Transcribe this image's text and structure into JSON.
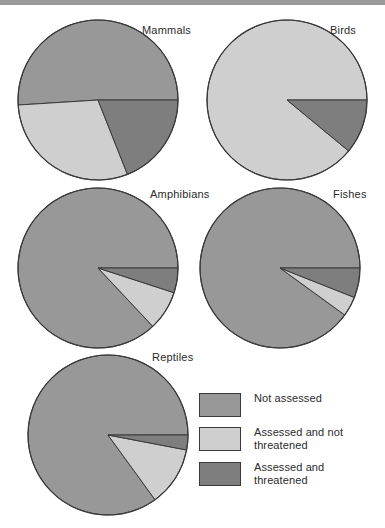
{
  "page": {
    "background": "#ffffff",
    "top_band_color": "#9a9a9a"
  },
  "legend": {
    "items": [
      {
        "label": "Not assessed",
        "color": "#989898",
        "key": "not_assessed"
      },
      {
        "label": "Assessed and not threatened",
        "color": "#cfcfcf",
        "key": "assessed_not_threatened"
      },
      {
        "label": "Assessed and threatened",
        "color": "#7e7e7e",
        "key": "assessed_threatened"
      }
    ]
  },
  "labels": {
    "mammals": "Mammals",
    "birds": "Birds",
    "amphibians": "Amphibians",
    "fishes": "Fishes",
    "reptiles": "Reptiles"
  },
  "chart_data": {
    "type": "pie",
    "title": "",
    "legend_position": "bottom-right",
    "categories": [
      "Not assessed",
      "Assessed and not threatened",
      "Assessed and threatened"
    ],
    "colors": [
      "#989898",
      "#cfcfcf",
      "#7e7e7e"
    ],
    "units": "percent",
    "charts": [
      {
        "name": "mammals",
        "title": "Mammals",
        "center": [
          98,
          100
        ],
        "radius": 80,
        "values": [
          51,
          30,
          19
        ]
      },
      {
        "name": "birds",
        "title": "Birds",
        "center": [
          287,
          100
        ],
        "radius": 80,
        "values": [
          0,
          89,
          11
        ]
      },
      {
        "name": "amphibians",
        "title": "Amphibians",
        "center": [
          98,
          268
        ],
        "radius": 80,
        "values": [
          87,
          8,
          5
        ]
      },
      {
        "name": "fishes",
        "title": "Fishes",
        "center": [
          280,
          268
        ],
        "radius": 80,
        "values": [
          90,
          4,
          6
        ]
      },
      {
        "name": "reptiles",
        "title": "Reptiles",
        "center": [
          108,
          435
        ],
        "radius": 80,
        "values": [
          85,
          12,
          3
        ]
      }
    ]
  }
}
